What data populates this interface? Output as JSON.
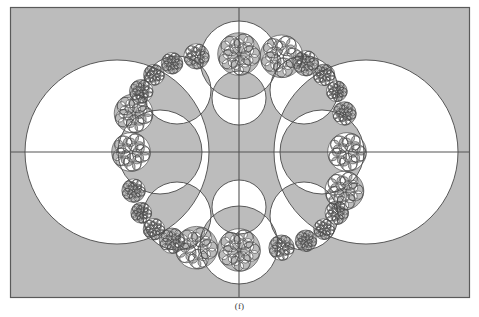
{
  "figure": {
    "caption": "(f)",
    "type": "geometric-diagram"
  },
  "colors": {
    "shade_fill": "#bcbcbc",
    "background": "#ffffff",
    "stroke": "#4a4a4a",
    "frame_stroke": "#5a5a5a",
    "axis_stroke": "#555555",
    "caption_text": "#3a3a3a"
  },
  "frame": {
    "x": 10.5,
    "y": 7.5,
    "width": 459,
    "height": 290,
    "stroke_width": 1.2
  },
  "axes": {
    "center_x": 239,
    "center_y": 152,
    "horizontal": {
      "x1": 11,
      "y1": 152,
      "x2": 469,
      "y2": 152
    },
    "vertical": {
      "x1": 239,
      "y1": 8,
      "x2": 239,
      "y2": 297
    },
    "stroke_width": 1.1
  },
  "chart_data": {
    "type": "scatter",
    "xlabel": "",
    "ylabel": "",
    "grid": false,
    "legend": "none",
    "xlim": [
      10.5,
      469.5
    ],
    "ylim": [
      7.5,
      297.5
    ],
    "circles": [
      {
        "name": "left-lobe",
        "cx": 117,
        "cy": 152,
        "r": 92
      },
      {
        "name": "right-lobe",
        "cx": 366,
        "cy": 152,
        "r": 92
      },
      {
        "name": "top-lobe",
        "cx": 239,
        "cy": 60,
        "r": 39
      },
      {
        "name": "bottom-lobe",
        "cx": 239,
        "cy": 245,
        "r": 39
      },
      {
        "name": "inner-left",
        "cx": 160,
        "cy": 152,
        "r": 42
      },
      {
        "name": "inner-right",
        "cx": 322,
        "cy": 152,
        "r": 42
      },
      {
        "name": "inner-top",
        "cx": 239,
        "cy": 98,
        "r": 27
      },
      {
        "name": "inner-bottom",
        "cx": 239,
        "cy": 207,
        "r": 27
      },
      {
        "name": "diag-nw",
        "cx": 177,
        "cy": 90,
        "r": 34
      },
      {
        "name": "diag-ne",
        "cx": 304,
        "cy": 90,
        "r": 34
      },
      {
        "name": "diag-sw",
        "cx": 177,
        "cy": 216,
        "r": 34
      },
      {
        "name": "diag-se",
        "cx": 304,
        "cy": 216,
        "r": 34
      }
    ],
    "chain": {
      "description": "A closed chain of tangent circles tracing a rounded-square (astroid-like) boundary, each subdivided recursively into smaller tangent circles.",
      "boundary_center": [
        239,
        152
      ],
      "boundary_radius_x": 108,
      "boundary_radius_y": 98,
      "beads": 24,
      "recursion_levels": 3
    }
  }
}
